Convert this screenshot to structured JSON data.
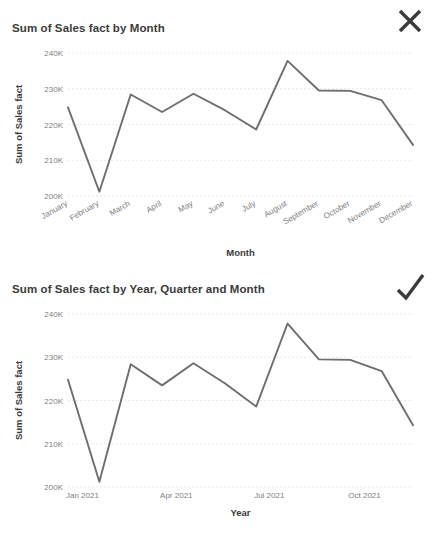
{
  "page": {
    "background": "#ffffff",
    "line_color": "#6e6e6e",
    "grid_color": "#e9e9e9",
    "text_color": "#3b3b3b",
    "tick_color": "#808080"
  },
  "panels": [
    {
      "id": "top",
      "title": "Sum of Sales fact by Month",
      "mark_icon": "close-icon",
      "mark_color": "#3b3b3b"
    },
    {
      "id": "bottom",
      "title": "Sum of Sales fact by Year, Quarter and Month",
      "mark_icon": "check-icon",
      "mark_color": "#3b3b3b"
    }
  ],
  "chart_data": [
    {
      "type": "line",
      "title": "Sum of Sales fact by Month",
      "xlabel": "Month",
      "ylabel": "Sum of Sales fact",
      "categories": [
        "January",
        "February",
        "March",
        "April",
        "May",
        "June",
        "July",
        "August",
        "September",
        "October",
        "November",
        "December"
      ],
      "values": [
        224800,
        201200,
        228400,
        223500,
        228600,
        224000,
        218600,
        237800,
        229500,
        229400,
        226800,
        214300
      ],
      "ytick_labels": [
        "200K",
        "210K",
        "220K",
        "230K",
        "240K"
      ],
      "ytick_values": [
        200000,
        210000,
        220000,
        230000,
        240000
      ],
      "ylim": [
        200000,
        240000
      ],
      "grid": true,
      "legend": "none",
      "xtick_rotation": -30
    },
    {
      "type": "line",
      "title": "Sum of Sales fact by Year, Quarter and Month",
      "xlabel": "Year",
      "ylabel": "Sum of Sales fact",
      "x": [
        "Jan 2021",
        "Feb 2021",
        "Mar 2021",
        "Apr 2021",
        "May 2021",
        "Jun 2021",
        "Jul 2021",
        "Aug 2021",
        "Sep 2021",
        "Oct 2021",
        "Nov 2021",
        "Dec 2021"
      ],
      "values": [
        224800,
        201200,
        228400,
        223500,
        228600,
        224000,
        218600,
        237800,
        229500,
        229400,
        226800,
        214300
      ],
      "xtick_labels": [
        "Jan 2021",
        "Apr 2021",
        "Jul 2021",
        "Oct 2021"
      ],
      "xtick_indices": [
        0,
        3,
        6,
        9
      ],
      "ytick_labels": [
        "200K",
        "210K",
        "220K",
        "230K",
        "240K"
      ],
      "ytick_values": [
        200000,
        210000,
        220000,
        230000,
        240000
      ],
      "ylim": [
        200000,
        240000
      ],
      "grid": true,
      "legend": "none",
      "xtick_rotation": 0
    }
  ]
}
